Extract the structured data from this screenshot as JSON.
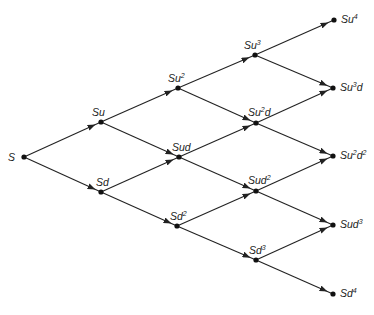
{
  "diagram": {
    "colors": {
      "line": "#222222",
      "node": "#111111",
      "text": "#1a1a1a",
      "background": "#ffffff"
    },
    "nodes": [
      {
        "id": "S",
        "base": "S",
        "sup": "",
        "tail": "",
        "sup2": "",
        "x": 24,
        "y": 157,
        "lx": 8,
        "ly": 152,
        "step": 0
      },
      {
        "id": "Su",
        "base": "Su",
        "sup": "",
        "tail": "",
        "sup2": "",
        "x": 101,
        "y": 122,
        "lx": 92,
        "ly": 107,
        "step": 1
      },
      {
        "id": "Sd",
        "base": "Sd",
        "sup": "",
        "tail": "",
        "sup2": "",
        "x": 101,
        "y": 192,
        "lx": 96,
        "ly": 177,
        "step": 1
      },
      {
        "id": "Su2",
        "base": "Su",
        "sup": "2",
        "tail": "",
        "sup2": "",
        "x": 178,
        "y": 88,
        "lx": 168,
        "ly": 73,
        "step": 2
      },
      {
        "id": "Sud",
        "base": "Sud",
        "sup": "",
        "tail": "",
        "sup2": "",
        "x": 179,
        "y": 157,
        "lx": 172,
        "ly": 142,
        "step": 2
      },
      {
        "id": "Sd2",
        "base": "Sd",
        "sup": "2",
        "tail": "",
        "sup2": "",
        "x": 177,
        "y": 226,
        "lx": 170,
        "ly": 211,
        "step": 2
      },
      {
        "id": "Su3",
        "base": "Su",
        "sup": "3",
        "tail": "",
        "sup2": "",
        "x": 255,
        "y": 55,
        "lx": 244,
        "ly": 40,
        "step": 3
      },
      {
        "id": "Su2d",
        "base": "Su",
        "sup": "2",
        "tail": "d",
        "sup2": "",
        "x": 256,
        "y": 123,
        "lx": 248,
        "ly": 107,
        "step": 3
      },
      {
        "id": "Sud2",
        "base": "Sud",
        "sup": "2",
        "tail": "",
        "sup2": "",
        "x": 256,
        "y": 191,
        "lx": 248,
        "ly": 175,
        "step": 3
      },
      {
        "id": "Sd3",
        "base": "Sd",
        "sup": "3",
        "tail": "",
        "sup2": "",
        "x": 256,
        "y": 260,
        "lx": 249,
        "ly": 245,
        "step": 3
      },
      {
        "id": "Su4",
        "base": "Su",
        "sup": "4",
        "tail": "",
        "sup2": "",
        "x": 334,
        "y": 20,
        "lx": 341,
        "ly": 14,
        "step": 4
      },
      {
        "id": "Su3d",
        "base": "Su",
        "sup": "3",
        "tail": "d",
        "sup2": "",
        "x": 333,
        "y": 88,
        "lx": 340,
        "ly": 82,
        "step": 4
      },
      {
        "id": "Su2d2",
        "base": "Su",
        "sup": "2",
        "tail": "d",
        "sup2": "2",
        "x": 333,
        "y": 156,
        "lx": 340,
        "ly": 150,
        "step": 4
      },
      {
        "id": "Sud3",
        "base": "Sud",
        "sup": "3",
        "tail": "",
        "sup2": "",
        "x": 333,
        "y": 225,
        "lx": 340,
        "ly": 219,
        "step": 4
      },
      {
        "id": "Sd4",
        "base": "Sd",
        "sup": "4",
        "tail": "",
        "sup2": "",
        "x": 333,
        "y": 294,
        "lx": 340,
        "ly": 288,
        "step": 4
      }
    ],
    "edges": [
      [
        "S",
        "Su"
      ],
      [
        "S",
        "Sd"
      ],
      [
        "Su",
        "Su2"
      ],
      [
        "Su",
        "Sud"
      ],
      [
        "Sd",
        "Sud"
      ],
      [
        "Sd",
        "Sd2"
      ],
      [
        "Su2",
        "Su3"
      ],
      [
        "Su2",
        "Su2d"
      ],
      [
        "Sud",
        "Su2d"
      ],
      [
        "Sud",
        "Sud2"
      ],
      [
        "Sd2",
        "Sud2"
      ],
      [
        "Sd2",
        "Sd3"
      ],
      [
        "Su3",
        "Su4"
      ],
      [
        "Su3",
        "Su3d"
      ],
      [
        "Su2d",
        "Su3d"
      ],
      [
        "Su2d",
        "Su2d2"
      ],
      [
        "Sud2",
        "Su2d2"
      ],
      [
        "Sud2",
        "Sud3"
      ],
      [
        "Sd3",
        "Sud3"
      ],
      [
        "Sd3",
        "Sd4"
      ]
    ]
  }
}
